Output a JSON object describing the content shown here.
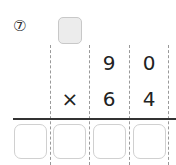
{
  "problem": {
    "number_label": "⑦",
    "multiplicand": [
      "9",
      "0"
    ],
    "operator": "×",
    "multiplier": [
      "6",
      "4"
    ],
    "carry_box_value": "",
    "answer_boxes": [
      "",
      "",
      "",
      ""
    ]
  },
  "colors": {
    "carry_box_fill": "#ececec",
    "box_border": "#d0d0d0",
    "rule": "#333333"
  }
}
